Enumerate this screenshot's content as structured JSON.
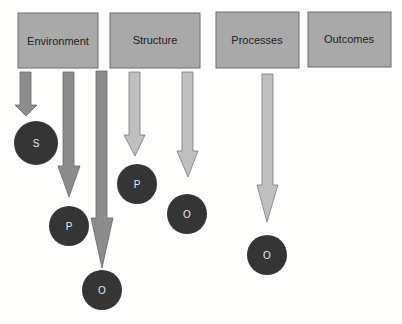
{
  "diagram": {
    "colors": {
      "background": "#fdfdfb",
      "box_fill": "#a9a9a9",
      "box_stroke": "#6e6e6e",
      "arrow_dark": "#8c8c8c",
      "arrow_light": "#bfbfbf",
      "arrow_stroke": "#6a6a6a",
      "node_fill": "#353535"
    },
    "boxes": [
      {
        "id": "environment",
        "label": "Environment"
      },
      {
        "id": "structure",
        "label": "Structure"
      },
      {
        "id": "processes",
        "label": "Processes"
      },
      {
        "id": "outcomes",
        "label": "Outcomes"
      }
    ],
    "nodes": [
      {
        "from": "Environment",
        "label": "S"
      },
      {
        "from": "Environment",
        "label": "P"
      },
      {
        "from": "Environment",
        "label": "O"
      },
      {
        "from": "Structure",
        "label": "P"
      },
      {
        "from": "Structure",
        "label": "O"
      },
      {
        "from": "Processes",
        "label": "O"
      }
    ]
  }
}
